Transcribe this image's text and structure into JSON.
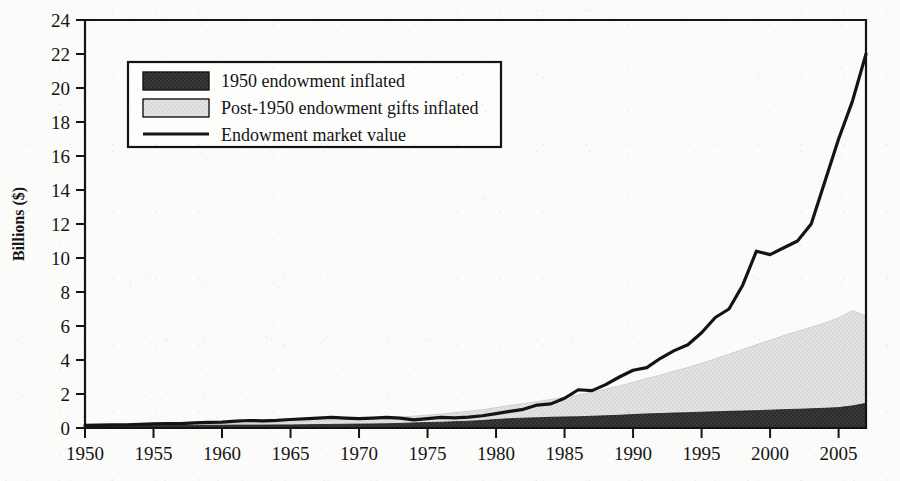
{
  "figure": {
    "kind": "scanned-book-figure",
    "background_color": "#fbfbfa",
    "ink_color": "#141414"
  },
  "axes": {
    "y_title": "Billions ($)",
    "y_ticks": [
      "0",
      "2",
      "4",
      "6",
      "8",
      "10",
      "12",
      "14",
      "16",
      "18",
      "20",
      "22",
      "24"
    ],
    "x_ticks": [
      "1950",
      "1955",
      "1960",
      "1965",
      "1970",
      "1975",
      "1980",
      "1985",
      "1990",
      "1995",
      "2000",
      "2005"
    ]
  },
  "legend": {
    "items": [
      {
        "label": "1950 endowment inflated",
        "swatch": "dark-fill",
        "color": "#2b2b2b"
      },
      {
        "label": "Post-1950 endowment gifts inflated",
        "swatch": "light-fill",
        "color": "#e0e0e0"
      },
      {
        "label": "Endowment market value",
        "swatch": "line",
        "color": "#141414"
      }
    ]
  },
  "chart_data": {
    "type": "area",
    "title": "",
    "xlabel": "",
    "ylabel": "Billions ($)",
    "xlim": [
      1950,
      2007
    ],
    "ylim": [
      0,
      24
    ],
    "ytick_step": 2,
    "xtick_step": 5,
    "grid": false,
    "legend_position": "upper-left-inside",
    "x": [
      1950,
      1951,
      1952,
      1953,
      1954,
      1955,
      1956,
      1957,
      1958,
      1959,
      1960,
      1961,
      1962,
      1963,
      1964,
      1965,
      1966,
      1967,
      1968,
      1969,
      1970,
      1971,
      1972,
      1973,
      1974,
      1975,
      1976,
      1977,
      1978,
      1979,
      1980,
      1981,
      1982,
      1983,
      1984,
      1985,
      1986,
      1987,
      1988,
      1989,
      1990,
      1991,
      1992,
      1993,
      1994,
      1995,
      1996,
      1997,
      1998,
      1999,
      2000,
      2001,
      2002,
      2003,
      2004,
      2005,
      2006,
      2007
    ],
    "series": [
      {
        "name": "1950 endowment inflated",
        "type": "stacked-area",
        "color": "#2b2b2b",
        "values": [
          0.12,
          0.13,
          0.13,
          0.13,
          0.14,
          0.14,
          0.14,
          0.15,
          0.15,
          0.16,
          0.16,
          0.17,
          0.17,
          0.17,
          0.18,
          0.18,
          0.19,
          0.2,
          0.21,
          0.22,
          0.23,
          0.24,
          0.25,
          0.27,
          0.3,
          0.32,
          0.34,
          0.37,
          0.4,
          0.44,
          0.5,
          0.55,
          0.58,
          0.6,
          0.63,
          0.65,
          0.66,
          0.69,
          0.72,
          0.75,
          0.79,
          0.83,
          0.85,
          0.88,
          0.9,
          0.93,
          0.95,
          0.98,
          1.0,
          1.02,
          1.05,
          1.08,
          1.1,
          1.13,
          1.16,
          1.2,
          1.3,
          1.45
        ]
      },
      {
        "name": "Post-1950 endowment gifts inflated",
        "type": "stacked-area",
        "color": "#e0e0e0",
        "values": [
          0.0,
          0.01,
          0.02,
          0.03,
          0.04,
          0.05,
          0.06,
          0.07,
          0.08,
          0.09,
          0.1,
          0.12,
          0.13,
          0.15,
          0.16,
          0.18,
          0.2,
          0.22,
          0.24,
          0.26,
          0.28,
          0.31,
          0.34,
          0.37,
          0.4,
          0.44,
          0.48,
          0.53,
          0.58,
          0.64,
          0.7,
          0.78,
          0.86,
          0.95,
          1.05,
          1.16,
          1.28,
          1.42,
          1.56,
          1.72,
          1.9,
          2.08,
          2.26,
          2.46,
          2.66,
          2.88,
          3.12,
          3.36,
          3.62,
          3.88,
          4.12,
          4.36,
          4.58,
          4.8,
          5.02,
          5.28,
          5.6,
          5.15
        ]
      },
      {
        "name": "Endowment market value",
        "type": "line",
        "color": "#141414",
        "values": [
          0.15,
          0.17,
          0.18,
          0.19,
          0.21,
          0.24,
          0.26,
          0.26,
          0.3,
          0.33,
          0.35,
          0.4,
          0.44,
          0.42,
          0.45,
          0.5,
          0.54,
          0.58,
          0.62,
          0.58,
          0.55,
          0.58,
          0.62,
          0.58,
          0.48,
          0.55,
          0.62,
          0.6,
          0.64,
          0.72,
          0.85,
          0.98,
          1.1,
          1.35,
          1.42,
          1.75,
          2.25,
          2.2,
          2.55,
          3.0,
          3.4,
          3.55,
          4.1,
          4.55,
          4.9,
          5.6,
          6.5,
          7.0,
          8.4,
          10.4,
          10.2,
          10.6,
          11.0,
          12.0,
          14.5,
          17.0,
          19.2,
          22.0
        ]
      }
    ]
  }
}
